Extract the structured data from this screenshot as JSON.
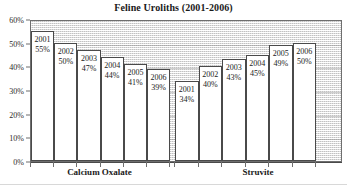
{
  "chart_data": {
    "type": "bar",
    "title": "Feline Uroliths (2001-2006)",
    "xlabel": "",
    "ylabel": "",
    "ylim": [
      0,
      60
    ],
    "ytick_labels": [
      "0%",
      "10%",
      "20%",
      "30%",
      "40%",
      "50%",
      "60%"
    ],
    "ytick_values": [
      0,
      10,
      20,
      30,
      40,
      50,
      60
    ],
    "grid": true,
    "legend": "none",
    "categories": [
      "Calcium Oxalate",
      "Struvite"
    ],
    "series_labels": [
      "2001",
      "2002",
      "2003",
      "2004",
      "2005",
      "2006"
    ],
    "groups": [
      {
        "category": "Calcium Oxalate",
        "bars": [
          {
            "year": "2001",
            "value": 55,
            "value_label": "55%"
          },
          {
            "year": "2002",
            "value": 50,
            "value_label": "50%"
          },
          {
            "year": "2003",
            "value": 47,
            "value_label": "47%"
          },
          {
            "year": "2004",
            "value": 44,
            "value_label": "44%"
          },
          {
            "year": "2005",
            "value": 41,
            "value_label": "41%"
          },
          {
            "year": "2006",
            "value": 39,
            "value_label": "39%"
          }
        ]
      },
      {
        "category": "Struvite",
        "bars": [
          {
            "year": "2001",
            "value": 34,
            "value_label": "34%"
          },
          {
            "year": "2002",
            "value": 40,
            "value_label": "40%"
          },
          {
            "year": "2003",
            "value": 43,
            "value_label": "43%"
          },
          {
            "year": "2004",
            "value": 45,
            "value_label": "45%"
          },
          {
            "year": "2005",
            "value": 49,
            "value_label": "49%"
          },
          {
            "year": "2006",
            "value": 50,
            "value_label": "50%"
          }
        ]
      }
    ],
    "colors": {
      "bar_fill": "#ffffff",
      "bar_border": "#4a4a4a",
      "plot_background": "#efefef",
      "text": "#1a1a1a",
      "axis": "#4a4a4a"
    }
  }
}
